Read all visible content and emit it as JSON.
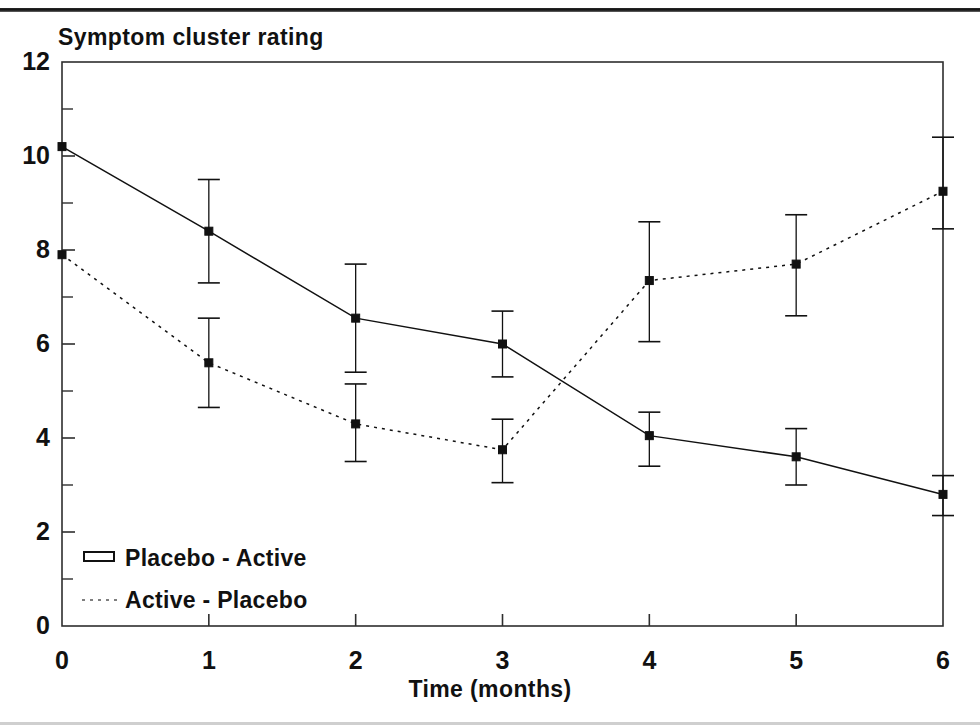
{
  "chart_data": {
    "type": "line",
    "title": "Symptom cluster rating",
    "xlabel": "Time (months)",
    "ylabel": "",
    "x": [
      0,
      1,
      2,
      3,
      4,
      5,
      6
    ],
    "xtick_labels": [
      "0",
      "1",
      "2",
      "3",
      "4",
      "5",
      "6"
    ],
    "ytick_labels": [
      "0",
      "2",
      "4",
      "6",
      "8",
      "10",
      "12"
    ],
    "ytick_values": [
      0,
      2,
      4,
      6,
      8,
      10,
      12
    ],
    "yminor_values": [
      1,
      3,
      5,
      7,
      9,
      11
    ],
    "xlim": [
      0,
      6
    ],
    "ylim": [
      0,
      12
    ],
    "grid": false,
    "legend_position": "inside-bottom-left",
    "series": [
      {
        "name": "Placebo - Active",
        "style": "solid",
        "marker": "square",
        "values": [
          10.2,
          8.4,
          6.55,
          6.0,
          4.05,
          3.6,
          2.8
        ],
        "err_low": [
          10.2,
          7.3,
          5.4,
          5.3,
          3.4,
          3.0,
          2.35
        ],
        "err_high": [
          10.2,
          9.5,
          7.7,
          6.7,
          4.55,
          4.2,
          3.2
        ]
      },
      {
        "name": "Active - Placebo",
        "style": "dotted",
        "marker": "square",
        "values": [
          7.9,
          5.6,
          4.3,
          3.75,
          7.35,
          7.7,
          9.25
        ],
        "err_low": [
          7.9,
          4.65,
          3.5,
          3.05,
          6.05,
          6.6,
          8.45
        ],
        "err_high": [
          7.9,
          6.55,
          5.15,
          4.4,
          8.6,
          8.75,
          10.4
        ]
      }
    ],
    "legend": [
      {
        "label": "Placebo - Active",
        "style": "solid-bar"
      },
      {
        "label": "Active - Placebo",
        "style": "dotted"
      }
    ]
  },
  "colors": {
    "ink": "#111111",
    "axis": "#333333",
    "plot_background": "#ffffff"
  }
}
